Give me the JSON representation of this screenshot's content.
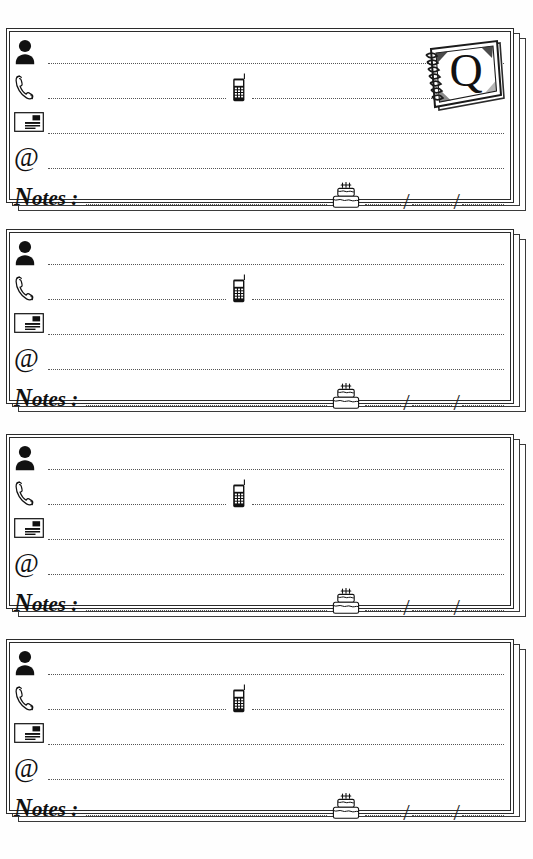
{
  "page": {
    "background_color": "#fefefe",
    "ink_color": "#1a1a1a",
    "card_count": 4
  },
  "notebook_badge": {
    "letter": "Q",
    "icon": "spiral-notebook-icon",
    "present_on_card_index": 0
  },
  "row_labels": {
    "name": "",
    "phone": "",
    "card": "",
    "email": "",
    "notes": "Notes :",
    "notes_capital": "N",
    "notes_rest": "otes :"
  },
  "icons": {
    "name": "person-icon",
    "phone": "telephone-handset-icon",
    "mobile": "mobile-phone-icon",
    "card": "business-card-icon",
    "email": "at-sign-icon",
    "at_glyph": "@",
    "birthday": "birthday-cake-icon"
  },
  "date_field": {
    "separator": "/",
    "separator_2": "/",
    "segments": [
      "",
      "",
      ""
    ]
  },
  "cards": [
    {
      "index": 1,
      "has_notebook_badge": true,
      "fields": {
        "name_value": "",
        "phone_value": "",
        "mobile_value": "",
        "card_value": "",
        "email_value": "",
        "notes_value": "",
        "birthday_value": ""
      }
    },
    {
      "index": 2,
      "has_notebook_badge": false,
      "fields": {
        "name_value": "",
        "phone_value": "",
        "mobile_value": "",
        "card_value": "",
        "email_value": "",
        "notes_value": "",
        "birthday_value": ""
      }
    },
    {
      "index": 3,
      "has_notebook_badge": false,
      "fields": {
        "name_value": "",
        "phone_value": "",
        "mobile_value": "",
        "card_value": "",
        "email_value": "",
        "notes_value": "",
        "birthday_value": ""
      }
    },
    {
      "index": 4,
      "has_notebook_badge": false,
      "fields": {
        "name_value": "",
        "phone_value": "",
        "mobile_value": "",
        "card_value": "",
        "email_value": "",
        "notes_value": "",
        "birthday_value": ""
      }
    }
  ]
}
